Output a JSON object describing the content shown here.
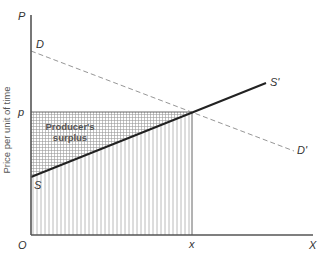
{
  "diagram": {
    "type": "producer-surplus",
    "colors": {
      "axis": "#555555",
      "supply_line": "#222222",
      "demand_line": "#999999",
      "grid_hatch": "#aaaaaa",
      "vertical_hatch": "#b5b5b5"
    },
    "axes": {
      "y_axis_symbol": "P",
      "x_axis_symbol": "X",
      "origin_label": "O",
      "y_axis_title": "Price per unit of time"
    },
    "levels": {
      "price_label": "p",
      "quantity_label": "x"
    },
    "curves": {
      "supply_start_label": "S",
      "supply_end_label": "S'",
      "demand_start_label": "D",
      "demand_end_label": "D'"
    },
    "regions": {
      "producer_surplus_line1": "Producer's",
      "producer_surplus_line2": "surplus"
    }
  }
}
